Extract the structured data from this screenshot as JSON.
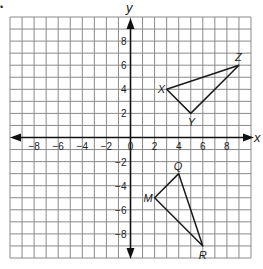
{
  "diagram": {
    "type": "coordinate-plane",
    "marker": "•",
    "axes": {
      "x_label": "x",
      "y_label": "y",
      "x_range": [
        -10,
        10
      ],
      "y_range": [
        -10,
        10
      ],
      "x_ticks": [
        {
          "value": -8,
          "label": "−8"
        },
        {
          "value": -6,
          "label": "−6"
        },
        {
          "value": -4,
          "label": "−4"
        },
        {
          "value": -2,
          "label": "−2"
        },
        {
          "value": 0,
          "label": "0"
        },
        {
          "value": 2,
          "label": "2"
        },
        {
          "value": 4,
          "label": "4"
        },
        {
          "value": 6,
          "label": "6"
        },
        {
          "value": 8,
          "label": "8"
        }
      ],
      "y_ticks": [
        {
          "value": 8,
          "label": "8"
        },
        {
          "value": 6,
          "label": "6"
        },
        {
          "value": 4,
          "label": "4"
        },
        {
          "value": 2,
          "label": "2"
        },
        {
          "value": -2,
          "label": "−2"
        },
        {
          "value": -4,
          "label": "−4"
        },
        {
          "value": -6,
          "label": "−6"
        },
        {
          "value": -8,
          "label": "−8"
        }
      ],
      "grid": true,
      "grid_step": 1
    },
    "triangles": [
      {
        "name": "XYZ",
        "vertices": [
          {
            "label": "X",
            "x": 3,
            "y": 4,
            "dx": -9,
            "dy": 4
          },
          {
            "label": "Y",
            "x": 5,
            "y": 2,
            "dx": -3,
            "dy": 13
          },
          {
            "label": "Z",
            "x": 9,
            "y": 6,
            "dx": -4,
            "dy": -4
          }
        ]
      },
      {
        "name": "MQR",
        "vertices": [
          {
            "label": "M",
            "x": 2,
            "y": -5,
            "dx": -11,
            "dy": 4
          },
          {
            "label": "Q",
            "x": 4,
            "y": -3,
            "dx": -5,
            "dy": -4
          },
          {
            "label": "R",
            "x": 6,
            "y": -9,
            "dx": -4,
            "dy": 13
          }
        ]
      }
    ]
  }
}
